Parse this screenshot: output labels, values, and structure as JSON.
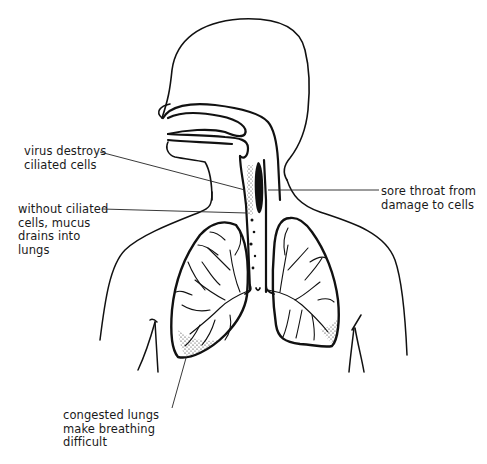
{
  "diagram": {
    "labels": {
      "virus": {
        "lines": [
          "virus destroys",
          "ciliated cells"
        ],
        "points_to": "upper trachea lining"
      },
      "mucus": {
        "lines": [
          "without ciliated",
          "cells, mucus",
          "drains into",
          "lungs"
        ],
        "points_to": "lower trachea"
      },
      "sore_throat": {
        "lines": [
          "sore throat from",
          "damage to cells"
        ],
        "points_to": "throat"
      },
      "congested": {
        "lines": [
          "congested lungs",
          "make breathing",
          "difficult"
        ],
        "points_to": "base of right lung"
      }
    },
    "parts": [
      "head",
      "nasal cavity",
      "mouth",
      "pharynx",
      "trachea",
      "bronchi",
      "left lung",
      "right lung",
      "shoulders",
      "arms"
    ],
    "colors": {
      "line": "#111111",
      "text": "#1a1a1a",
      "background": "#ffffff"
    }
  }
}
